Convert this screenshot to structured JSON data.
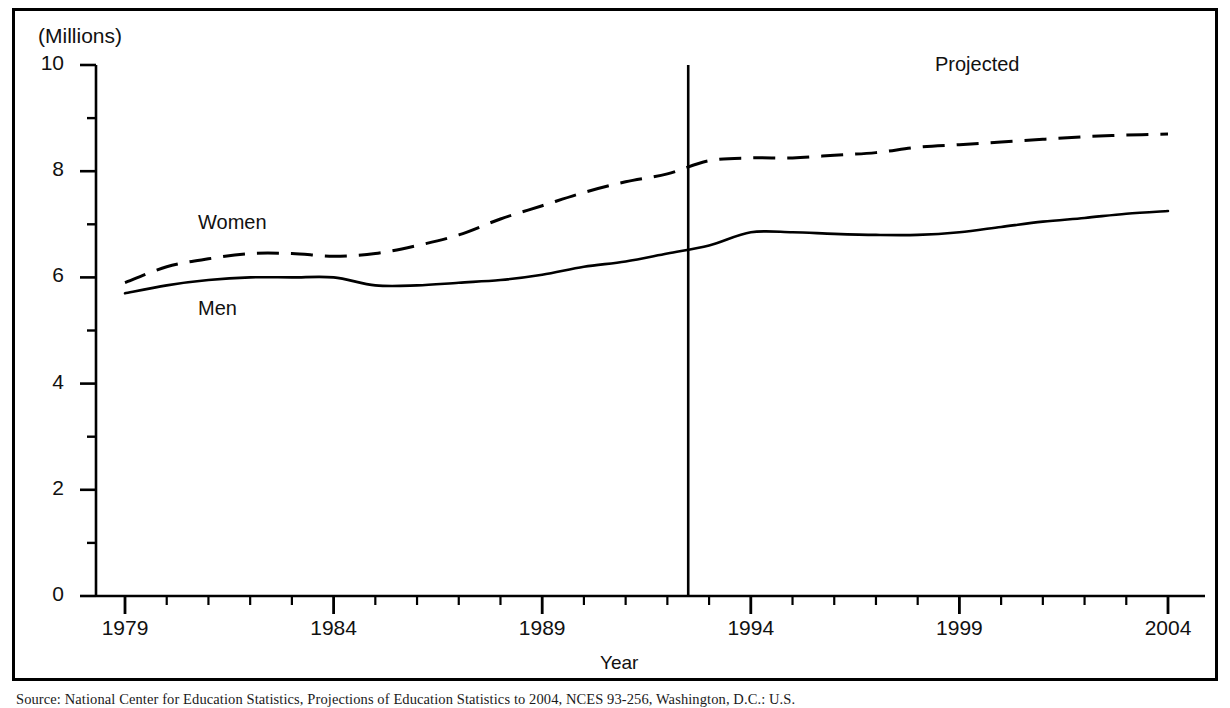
{
  "figure": {
    "units_label": "(Millions)",
    "xaxis_title": "Year",
    "projected_label": "Projected",
    "source_note": "Source: National Center for Education Statistics, Projections of Education Statistics to 2004, NCES 93-256, Washington, D.C.: U.S."
  },
  "chart_data": {
    "type": "line",
    "title": "",
    "xlabel": "Year",
    "ylabel": "(Millions)",
    "xlim": [
      1979,
      2004
    ],
    "ylim": [
      0,
      10
    ],
    "grid": false,
    "legend": "inline-labels",
    "yticks": [
      0,
      2,
      4,
      6,
      8,
      10
    ],
    "yticks_minor": [
      1,
      3,
      5,
      7,
      9
    ],
    "xticks": [
      1979,
      1984,
      1989,
      1994,
      1999,
      2004
    ],
    "xticks_minor": [
      1980,
      1981,
      1982,
      1983,
      1985,
      1986,
      1987,
      1988,
      1990,
      1991,
      1992,
      1993,
      1995,
      1996,
      1997,
      1998,
      2000,
      2001,
      2002,
      2003
    ],
    "projection_divider_x": 1992.5,
    "x": [
      1979,
      1980,
      1981,
      1982,
      1983,
      1984,
      1985,
      1986,
      1987,
      1988,
      1989,
      1990,
      1991,
      1992,
      1993,
      1994,
      1995,
      1996,
      1997,
      1998,
      1999,
      2000,
      2001,
      2002,
      2003,
      2004
    ],
    "series": [
      {
        "name": "Women",
        "style": "dashed",
        "values": [
          5.9,
          6.2,
          6.35,
          6.45,
          6.45,
          6.4,
          6.45,
          6.6,
          6.8,
          7.1,
          7.35,
          7.6,
          7.8,
          7.95,
          8.2,
          8.25,
          8.25,
          8.3,
          8.35,
          8.45,
          8.5,
          8.55,
          8.6,
          8.65,
          8.68,
          8.7
        ]
      },
      {
        "name": "Men",
        "style": "solid",
        "values": [
          5.7,
          5.85,
          5.95,
          6.0,
          6.0,
          6.0,
          5.85,
          5.85,
          5.9,
          5.95,
          6.05,
          6.2,
          6.3,
          6.45,
          6.6,
          6.85,
          6.85,
          6.82,
          6.8,
          6.8,
          6.85,
          6.95,
          7.05,
          7.12,
          7.2,
          7.25
        ]
      }
    ]
  }
}
